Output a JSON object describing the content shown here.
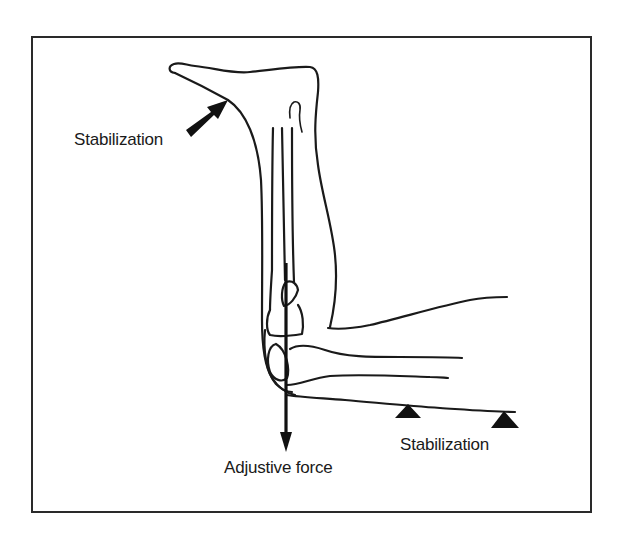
{
  "figure": {
    "labels": {
      "stabilization_top": "Stabilization",
      "stabilization_bottom": "Stabilization",
      "adjustive_force": "Adjustive force"
    },
    "elements": {
      "stabilization_arrow": "Stabilization arrow pointing at dorsum of foot",
      "adjustive_force_arrow": "Downward adjustive force vector through knee",
      "stabilization_supports": 2
    },
    "colors": {
      "line": "#1a1a1a",
      "background": "#ffffff"
    }
  }
}
